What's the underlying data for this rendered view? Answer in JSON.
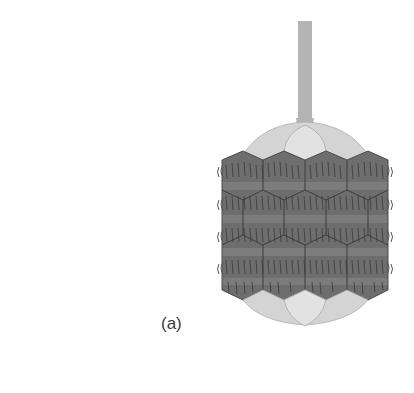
{
  "figure": {
    "panel_label": "(a)",
    "colors": {
      "background": "#ffffff",
      "tail": "#b4b4b4",
      "cap_light": "#d6d6d6",
      "cap_center": "#e2e2e2",
      "hex_body": "#6e6e6e",
      "hex_edge": "#3c3c3c",
      "fiber": "#3a3a3a",
      "band_light": "#7c7c7c"
    }
  }
}
